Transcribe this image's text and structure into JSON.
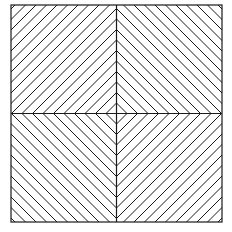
{
  "diagram": {
    "background": "#ffffff",
    "stroke_color": "#1a1a1a",
    "frame": {
      "x0": 11,
      "y0": 5,
      "x1": 222,
      "y1": 222
    },
    "center": {
      "x": 116.5,
      "y": 113.5
    },
    "diamond_count": 11,
    "diamond_spacing": 10.5
  }
}
